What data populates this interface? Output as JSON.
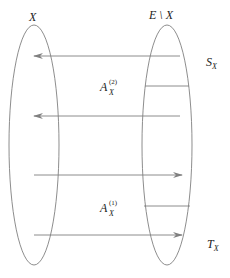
{
  "diagram": {
    "sets": {
      "left": {
        "label": "X"
      },
      "right": {
        "label": "E \\ X"
      }
    },
    "regions": {
      "top": {
        "label_main": "S",
        "label_sub": "X"
      },
      "bottom": {
        "label_main": "T",
        "label_sub": "X"
      }
    },
    "groups": [
      {
        "label_main": "A",
        "label_sub": "X",
        "label_sup": "(2)",
        "arrow_direction": "right-to-left",
        "arrow_count": 2
      },
      {
        "label_main": "A",
        "label_sub": "X",
        "label_sup": "(1)",
        "arrow_direction": "left-to-right",
        "arrow_count": 2
      }
    ],
    "colors": {
      "stroke": "#808080",
      "text": "#222222"
    }
  }
}
